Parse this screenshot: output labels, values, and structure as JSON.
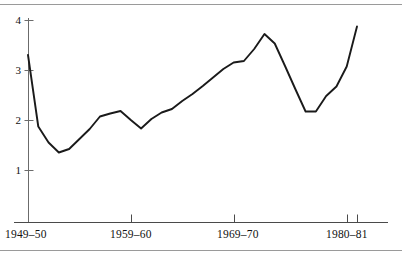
{
  "chart_data": {
    "type": "line",
    "title": "",
    "subtitle": "",
    "xlabel": "",
    "ylabel": "",
    "ylim": [
      0,
      4
    ],
    "xlim": [
      1949,
      1981
    ],
    "grid": false,
    "legend": null,
    "y_ticks": [
      "1",
      "2",
      "3",
      "4"
    ],
    "y_tick_values": [
      1,
      2,
      3,
      4
    ],
    "x_ticks": [
      "1949–50",
      "1959–60",
      "1969–70",
      "1980–81"
    ],
    "x_tick_values": [
      1949,
      1959,
      1969,
      1980
    ],
    "extra_x_tick_value": 1981,
    "series": [
      {
        "name": "series-1",
        "x": [
          1949,
          1950,
          1951,
          1952,
          1953,
          1954,
          1955,
          1956,
          1957,
          1958,
          1959,
          1960,
          1961,
          1962,
          1963,
          1964,
          1965,
          1966,
          1967,
          1968,
          1969,
          1970,
          1971,
          1972,
          1973,
          1974,
          1975,
          1976,
          1977,
          1978,
          1979,
          1980,
          1981
        ],
        "values": [
          3.3,
          1.87,
          1.55,
          1.35,
          1.42,
          1.62,
          1.82,
          2.07,
          2.13,
          2.18,
          2.0,
          1.83,
          2.02,
          2.15,
          2.22,
          2.38,
          2.52,
          2.68,
          2.85,
          3.02,
          3.15,
          3.18,
          3.42,
          3.72,
          3.53,
          3.08,
          2.62,
          2.17,
          2.17,
          2.48,
          2.67,
          3.07,
          3.87
        ]
      }
    ]
  },
  "axes": {
    "y_axis_name": "y-axis",
    "x_axis_name": "x-axis"
  },
  "colors": {
    "line": "#1a1a1a",
    "axis": "#6b6b6b",
    "rule": "#9a9a9a",
    "text": "#111111",
    "background": "#ffffff"
  }
}
